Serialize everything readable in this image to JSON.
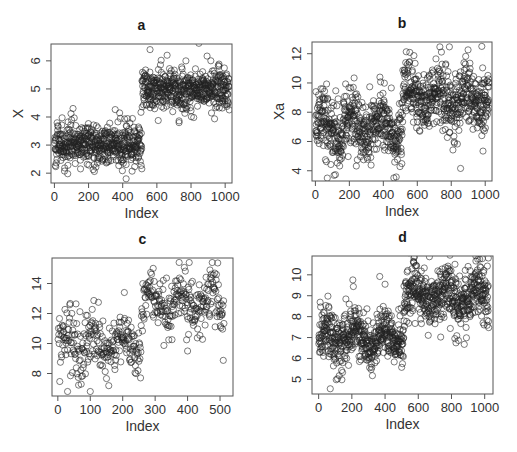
{
  "figure": {
    "panels": [
      "a",
      "b",
      "c",
      "d"
    ]
  },
  "chart_data": [
    {
      "id": "a",
      "type": "scatter",
      "title": "a",
      "xlabel": "Index",
      "ylabel": "X",
      "xlim": [
        -20,
        1040
      ],
      "ylim": [
        1.65,
        6.6
      ],
      "xticks": [
        0,
        200,
        400,
        600,
        800,
        1000
      ],
      "yticks": [
        2,
        3,
        4,
        5,
        6
      ],
      "grid": false,
      "n_points": 1024,
      "marker": "open-circle",
      "segments": [
        {
          "from": 1,
          "to": 512,
          "mean": 3.0,
          "sd": 0.38
        },
        {
          "from": 513,
          "to": 1024,
          "mean": 5.0,
          "sd": 0.38
        }
      ],
      "notable_points": [
        {
          "x": 560,
          "y": 6.4
        },
        {
          "x": 660,
          "y": 6.2
        },
        {
          "x": 420,
          "y": 1.8
        },
        {
          "x": 730,
          "y": 3.8
        },
        {
          "x": 770,
          "y": 6.0
        }
      ]
    },
    {
      "id": "b",
      "type": "scatter",
      "title": "b",
      "xlabel": "Index",
      "ylabel": "Xa",
      "xlim": [
        -20,
        1040
      ],
      "ylim": [
        3.3,
        12.8
      ],
      "xticks": [
        0,
        200,
        400,
        600,
        800,
        1000
      ],
      "yticks": [
        4,
        6,
        8,
        10,
        12
      ],
      "grid": false,
      "n_points": 1024,
      "marker": "open-circle",
      "segments": [
        {
          "from": 1,
          "to": 512,
          "mean": 7.0,
          "sd": 1.1,
          "oscillation_amp": 0.8,
          "oscillation_period": 170
        },
        {
          "from": 513,
          "to": 1024,
          "mean": 9.0,
          "sd": 1.1,
          "oscillation_amp": 0.8,
          "oscillation_period": 170
        }
      ],
      "notable_points": [
        {
          "x": 980,
          "y": 12.5
        },
        {
          "x": 70,
          "y": 3.5
        },
        {
          "x": 380,
          "y": 10.4
        },
        {
          "x": 980,
          "y": 6.4
        }
      ]
    },
    {
      "id": "c",
      "type": "scatter",
      "title": "c",
      "xlabel": "Index",
      "ylabel": "",
      "xlim": [
        -18,
        540
      ],
      "ylim": [
        6.5,
        15.7
      ],
      "xticks": [
        0,
        100,
        200,
        300,
        400,
        500
      ],
      "yticks": [
        8,
        10,
        12,
        14
      ],
      "grid": false,
      "n_points": 512,
      "marker": "open-circle",
      "segments": [
        {
          "from": 1,
          "to": 256,
          "mean": 10.0,
          "sd": 1.1,
          "oscillation_amp": 0.7,
          "oscillation_period": 90
        },
        {
          "from": 257,
          "to": 512,
          "mean": 12.8,
          "sd": 1.0,
          "oscillation_amp": 0.7,
          "oscillation_period": 90
        }
      ],
      "notable_points": [
        {
          "x": 405,
          "y": 15.4
        },
        {
          "x": 30,
          "y": 6.8
        },
        {
          "x": 100,
          "y": 6.8
        },
        {
          "x": 205,
          "y": 13.4
        },
        {
          "x": 400,
          "y": 9.5
        }
      ]
    },
    {
      "id": "d",
      "type": "scatter",
      "title": "d",
      "xlabel": "Index",
      "ylabel": "",
      "xlim": [
        -40,
        1050
      ],
      "ylim": [
        4.3,
        10.9
      ],
      "xticks": [
        0,
        200,
        400,
        600,
        800,
        1000
      ],
      "yticks": [
        5,
        6,
        7,
        8,
        9,
        10
      ],
      "grid": false,
      "n_points": 1024,
      "marker": "open-circle",
      "segments": [
        {
          "from": 1,
          "to": 512,
          "mean": 7.0,
          "sd": 0.7,
          "oscillation_amp": 0.45,
          "oscillation_period": 180
        },
        {
          "from": 513,
          "to": 1024,
          "mean": 9.0,
          "sd": 0.7,
          "oscillation_amp": 0.45,
          "oscillation_period": 180
        }
      ],
      "notable_points": [
        {
          "x": 70,
          "y": 4.55
        },
        {
          "x": 400,
          "y": 9.55
        },
        {
          "x": 970,
          "y": 10.75
        },
        {
          "x": 820,
          "y": 6.95
        },
        {
          "x": 990,
          "y": 7.7
        }
      ]
    }
  ],
  "layout": {
    "panel_boxes": [
      {
        "left": 51,
        "top": 44,
        "right": 232,
        "bottom": 183
      },
      {
        "left": 312,
        "top": 42,
        "right": 492,
        "bottom": 181
      },
      {
        "left": 52,
        "top": 258,
        "right": 233,
        "bottom": 396
      },
      {
        "left": 312,
        "top": 256,
        "right": 493,
        "bottom": 394
      }
    ]
  }
}
